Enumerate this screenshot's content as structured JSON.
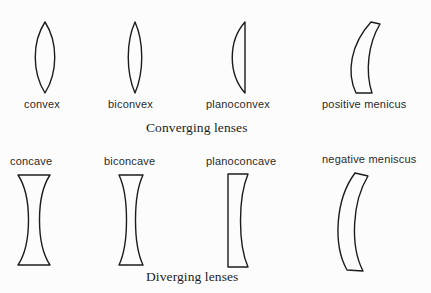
{
  "figure": {
    "background_color": "#fcfcfc",
    "stroke_color": "#1c1c1c"
  },
  "groups": [
    {
      "id": "converging",
      "caption": "Converging lenses",
      "lenses": [
        {
          "id": "convex",
          "label": "convex"
        },
        {
          "id": "biconvex",
          "label": "biconvex"
        },
        {
          "id": "planoconvex",
          "label": "planoconvex"
        },
        {
          "id": "posmeniscus",
          "label": "positive  menicus"
        }
      ]
    },
    {
      "id": "diverging",
      "caption": "Diverging lenses",
      "lenses": [
        {
          "id": "concave",
          "label": "concave"
        },
        {
          "id": "biconcave",
          "label": "biconcave"
        },
        {
          "id": "planoconcave",
          "label": "planoconcave"
        },
        {
          "id": "negmeniscus",
          "label": "negative  meniscus"
        }
      ]
    }
  ]
}
